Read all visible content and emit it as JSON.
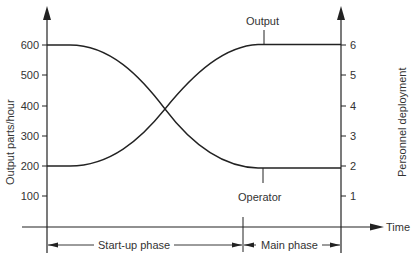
{
  "chart_data": {
    "type": "line",
    "title": "",
    "xlabel": "Time",
    "ylabel": "Output parts/hour",
    "y2label": "Personnel deployment",
    "ylim": [
      0,
      650
    ],
    "y2lim": [
      0,
      6.5
    ],
    "yticks": [
      "100",
      "200",
      "300",
      "400",
      "500",
      "600"
    ],
    "y2ticks": [
      "1",
      "2",
      "3",
      "4",
      "5",
      "6"
    ],
    "grid": false,
    "legend": "none (curves labeled directly)",
    "x": [
      0,
      0.1,
      0.2,
      0.3,
      0.4,
      0.5,
      0.6,
      0.7,
      0.8,
      0.9,
      1.0
    ],
    "series": [
      {
        "name": "Output",
        "axis": "left",
        "unit": "parts/hour",
        "values": [
          200,
          205,
          240,
          300,
          370,
          440,
          510,
          565,
          595,
          600,
          600
        ]
      },
      {
        "name": "Operator",
        "axis": "right",
        "unit": "personnel",
        "values": [
          6,
          5.95,
          5.6,
          5.0,
          4.3,
          3.6,
          2.9,
          2.35,
          2.05,
          2,
          2
        ]
      }
    ],
    "annotations": [
      {
        "text": "Output",
        "points_to": "Output curve plateau at 600"
      },
      {
        "text": "Operator",
        "points_to": "Operator curve plateau at 2"
      },
      {
        "text": "Start-up phase",
        "span": "from origin to phase boundary"
      },
      {
        "text": "Main phase",
        "span": "from phase boundary to right axis"
      }
    ],
    "crossing_point": {
      "output": 390,
      "personnel": 3.9
    }
  },
  "labels": {
    "left_axis_title": "Output parts/hour",
    "right_axis_title": "Personnel deployment",
    "x_axis_title": "Time",
    "output_curve": "Output",
    "operator_curve": "Operator",
    "startup_phase": "Start-up phase",
    "main_phase": "Main phase"
  },
  "left_ticks": [
    {
      "label": "600",
      "y": 45
    },
    {
      "label": "500",
      "y": 75
    },
    {
      "label": "400",
      "y": 106
    },
    {
      "label": "300",
      "y": 136
    },
    {
      "label": "200",
      "y": 166
    },
    {
      "label": "100",
      "y": 196
    }
  ],
  "right_ticks": [
    {
      "label": "6",
      "y": 45
    },
    {
      "label": "5",
      "y": 75
    },
    {
      "label": "4",
      "y": 106
    },
    {
      "label": "3",
      "y": 136
    },
    {
      "label": "2",
      "y": 166
    },
    {
      "label": "1",
      "y": 196
    }
  ],
  "colors": {
    "line": "#222222",
    "text": "#333333",
    "background": "#ffffff"
  }
}
